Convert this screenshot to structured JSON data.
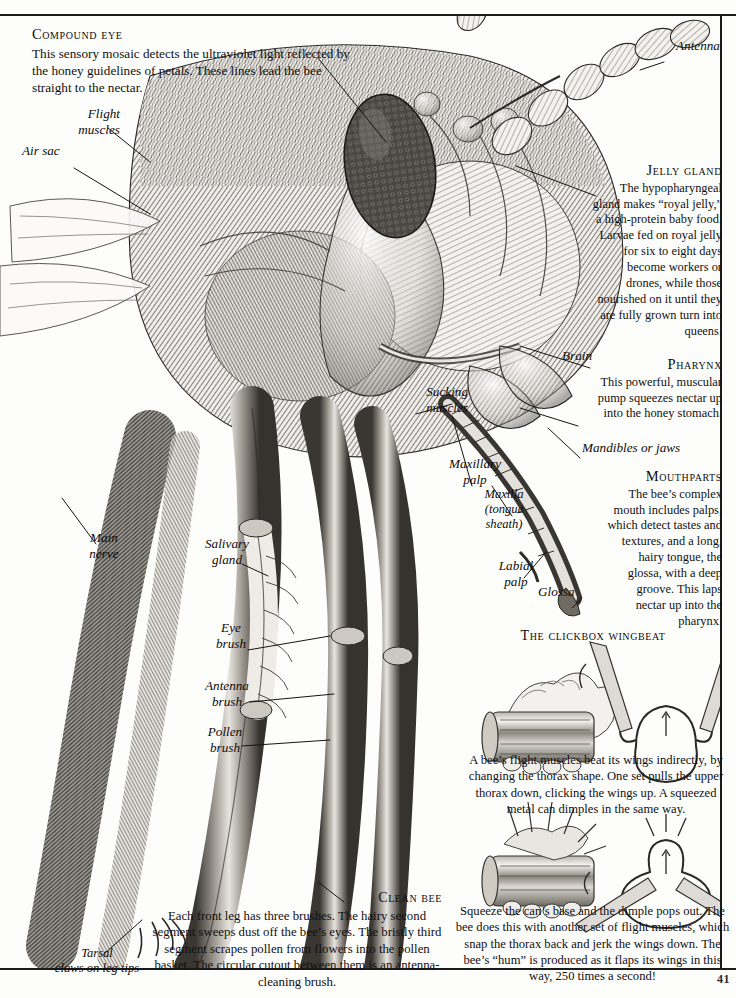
{
  "page": {
    "folio": "41"
  },
  "sections": {
    "compound_eye": {
      "heading": "Compound eye",
      "body": "This sensory mosaic detects the ultraviolet light reflected by the honey guidelines of petals. These lines lead the bee straight to the nectar."
    },
    "jelly_gland": {
      "heading": "Jelly gland",
      "body": "The hypopharyngeal gland makes “royal jelly,” a high-protein baby food. Larvae fed on royal jelly for six to eight days become workers or drones, while those nourished on it until they are fully grown turn into queens."
    },
    "pharynx": {
      "heading": "Pharynx",
      "body": "This powerful, muscular pump squeezes nectar up into the honey stomach."
    },
    "mouthparts": {
      "heading": "Mouthparts",
      "body": "The bee’s complex mouth includes palps, which detect tastes and textures, and a long, hairy tongue, the glossa, with a deep groove. This laps nectar up into the pharynx."
    },
    "clickbox": {
      "heading": "The clickbox wingbeat",
      "paragraph_1": "A bee’s flight muscles beat its wings indirectly, by changing the thorax shape. One set pulls the upper thorax down, clicking the wings up. A squeezed metal can dimples in the same way.",
      "paragraph_2": "Squeeze the can’s base and the dimple pops out. The bee does this with another set of flight muscles, which snap the thorax back and jerk the wings down. The bee’s “hum” is produced as it flaps its wings in this way, 250 times a second!"
    },
    "clean_bee": {
      "heading": "Clean bee",
      "body": "Each front leg has three brushes. The hairy second segment sweeps dust off the bee’s eyes. The bristly third segment scrapes pollen from flowers into the pollen basket. The circular cutout between them is an antenna-cleaning brush."
    }
  },
  "labels": {
    "antenna": "Antenna",
    "flight_muscles": "Flight\nmuscles",
    "air_sac": "Air sac",
    "brain": "Brain",
    "mandibles": "Mandibles or jaws",
    "sucking_muscles": "Sucking\nmuscles",
    "maxillary_palp": "Maxillary\npalp",
    "maxilla": "Maxilla\n(tongue\nsheath)",
    "labial_palp": "Labial\npalp",
    "glossa": "Glossa",
    "main_nerve": "Main\nnerve",
    "salivary_gland": "Salivary\ngland",
    "eye_brush": "Eye\nbrush",
    "antenna_brush": "Antenna\nbrush",
    "pollen_brush": "Pollen\nbrush",
    "tarsal_claws": "Tarsal\nclaws on leg tips"
  },
  "colors": {
    "ink": "#12100e",
    "rule": "#1a1a1a",
    "paper": "#fdfdfc",
    "engraving_dark": "#2b2926",
    "engraving_mid": "#6f6b66",
    "engraving_light": "#b9b5af"
  }
}
